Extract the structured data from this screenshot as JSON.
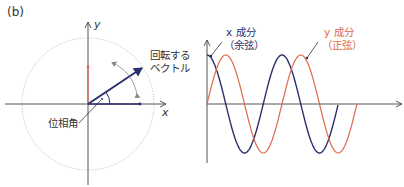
{
  "panel_label": "(b)",
  "colors": {
    "axis": "#555555",
    "circle": "#bbbbbb",
    "cosine": "#2a2f6e",
    "sine": "#e0684a",
    "text": "#333333"
  },
  "phasor": {
    "axis_x_label": "x",
    "axis_y_label": "y",
    "rotating_vector_label_line1": "回転する",
    "rotating_vector_label_line2": "ベクトル",
    "phase_angle_label": "位相角"
  },
  "waves": {
    "cosine_label_line1": "x 成分",
    "cosine_label_line2": "（余弦）",
    "sine_label_line1": "y 成分",
    "sine_label_line2": "（正弦）"
  }
}
